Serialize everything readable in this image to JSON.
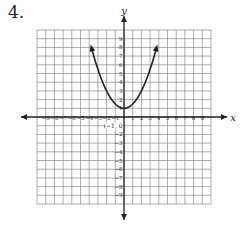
{
  "problem": {
    "number": "4."
  },
  "chart_data": {
    "type": "line",
    "title": "",
    "xlabel": "x",
    "ylabel": "y",
    "xlim": [
      -10,
      10
    ],
    "ylim": [
      -10,
      10
    ],
    "grid": true,
    "x_ticks": [
      -9,
      -8,
      -7,
      -6,
      -5,
      -4,
      -3,
      -2,
      -1,
      1,
      2,
      3,
      4,
      5,
      6,
      7,
      8,
      9
    ],
    "y_ticks": [
      -9,
      -8,
      -7,
      -6,
      -5,
      -4,
      -3,
      -2,
      -1,
      1,
      2,
      3,
      4,
      5,
      6,
      7,
      8,
      9
    ],
    "annotations": [
      {
        "text": "(−1, 0)",
        "x": -1,
        "y": 0
      }
    ],
    "series": [
      {
        "name": "parabola",
        "description": "upward-opening parabola, vertex (0, 1), arrows at both ends",
        "vertex": [
          0,
          1
        ],
        "x": [
          -3.75,
          -3,
          -2,
          -1,
          0,
          1,
          2,
          3,
          3.75
        ],
        "y": [
          8,
          5.5,
          3,
          1.5,
          1,
          1.5,
          3,
          5.5,
          8
        ]
      }
    ]
  }
}
